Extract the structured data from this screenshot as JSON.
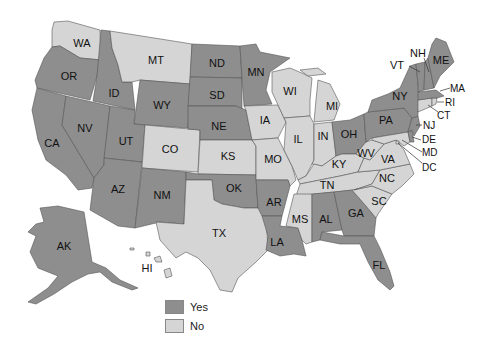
{
  "colors": {
    "yes": "#8e8e8e",
    "no": "#d5d5d5",
    "border": "#555555"
  },
  "legend": [
    {
      "key": "yes",
      "label": "Yes"
    },
    {
      "key": "no",
      "label": "No"
    }
  ],
  "states": {
    "WA": "no",
    "OR": "yes",
    "CA": "yes",
    "ID": "yes",
    "NV": "yes",
    "MT": "no",
    "WY": "yes",
    "UT": "yes",
    "AZ": "yes",
    "CO": "no",
    "NM": "yes",
    "ND": "yes",
    "SD": "yes",
    "NE": "yes",
    "KS": "no",
    "OK": "yes",
    "TX": "no",
    "MN": "yes",
    "IA": "no",
    "MO": "no",
    "AR": "yes",
    "LA": "yes",
    "WI": "no",
    "IL": "no",
    "MI": "no",
    "IN": "no",
    "OH": "yes",
    "KY": "no",
    "TN": "no",
    "MS": "no",
    "AL": "yes",
    "GA": "yes",
    "FL": "yes",
    "SC": "no",
    "NC": "no",
    "VA": "no",
    "WV": "no",
    "PA": "yes",
    "NY": "yes",
    "VT": "yes",
    "NH": "yes",
    "ME": "yes",
    "MA": "yes",
    "RI": "no",
    "CT": "no",
    "NJ": "yes",
    "DE": "yes",
    "MD": "no",
    "DC": "no",
    "AK": "yes",
    "HI": "no"
  },
  "labels": {
    "WA": "WA",
    "OR": "OR",
    "CA": "CA",
    "ID": "ID",
    "NV": "NV",
    "MT": "MT",
    "WY": "WY",
    "UT": "UT",
    "AZ": "AZ",
    "CO": "CO",
    "NM": "NM",
    "ND": "ND",
    "SD": "SD",
    "NE": "NE",
    "KS": "KS",
    "OK": "OK",
    "TX": "TX",
    "MN": "MN",
    "IA": "IA",
    "MO": "MO",
    "AR": "AR",
    "LA": "LA",
    "WI": "WI",
    "IL": "IL",
    "MI": "MI",
    "IN": "IN",
    "OH": "OH",
    "KY": "KY",
    "TN": "TN",
    "MS": "MS",
    "AL": "AL",
    "GA": "GA",
    "FL": "FL",
    "SC": "SC",
    "NC": "NC",
    "VA": "VA",
    "WV": "WV",
    "PA": "PA",
    "NY": "NY",
    "VT": "VT",
    "NH": "NH",
    "ME": "ME",
    "MA": "MA",
    "RI": "RI",
    "CT": "CT",
    "NJ": "NJ",
    "DE": "DE",
    "MD": "MD",
    "DC": "DC",
    "AK": "AK",
    "HI": "HI"
  }
}
